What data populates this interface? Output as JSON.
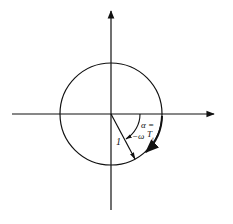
{
  "diagram": {
    "type": "unit-circle-rotation",
    "labels": {
      "radius": "1",
      "angle_line1": "α =",
      "angle_line2": "−ω",
      "angle_T": "T",
      "angle_sub": "t"
    },
    "colors": {
      "stroke": "#111111",
      "background": "#ffffff"
    }
  }
}
